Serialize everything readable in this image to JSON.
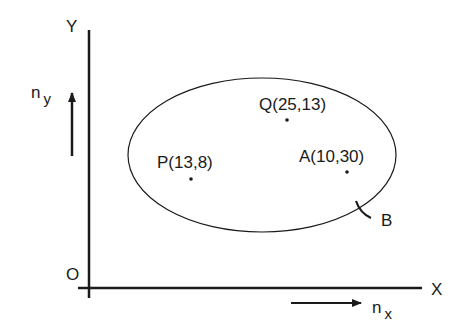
{
  "axes": {
    "y_label": "Y",
    "x_label": "X",
    "origin_label": "O"
  },
  "normals": {
    "ny": {
      "base": "n",
      "sub": "y"
    },
    "nx": {
      "base": "n",
      "sub": "x"
    }
  },
  "points": [
    {
      "name": "P",
      "label": "P(13,8)"
    },
    {
      "name": "Q",
      "label": "Q(25,13)"
    },
    {
      "name": "A",
      "label": "A(10,30)"
    }
  ],
  "boundary_label": "B",
  "colors": {
    "stroke": "#1a1a1a",
    "background": "#ffffff"
  }
}
